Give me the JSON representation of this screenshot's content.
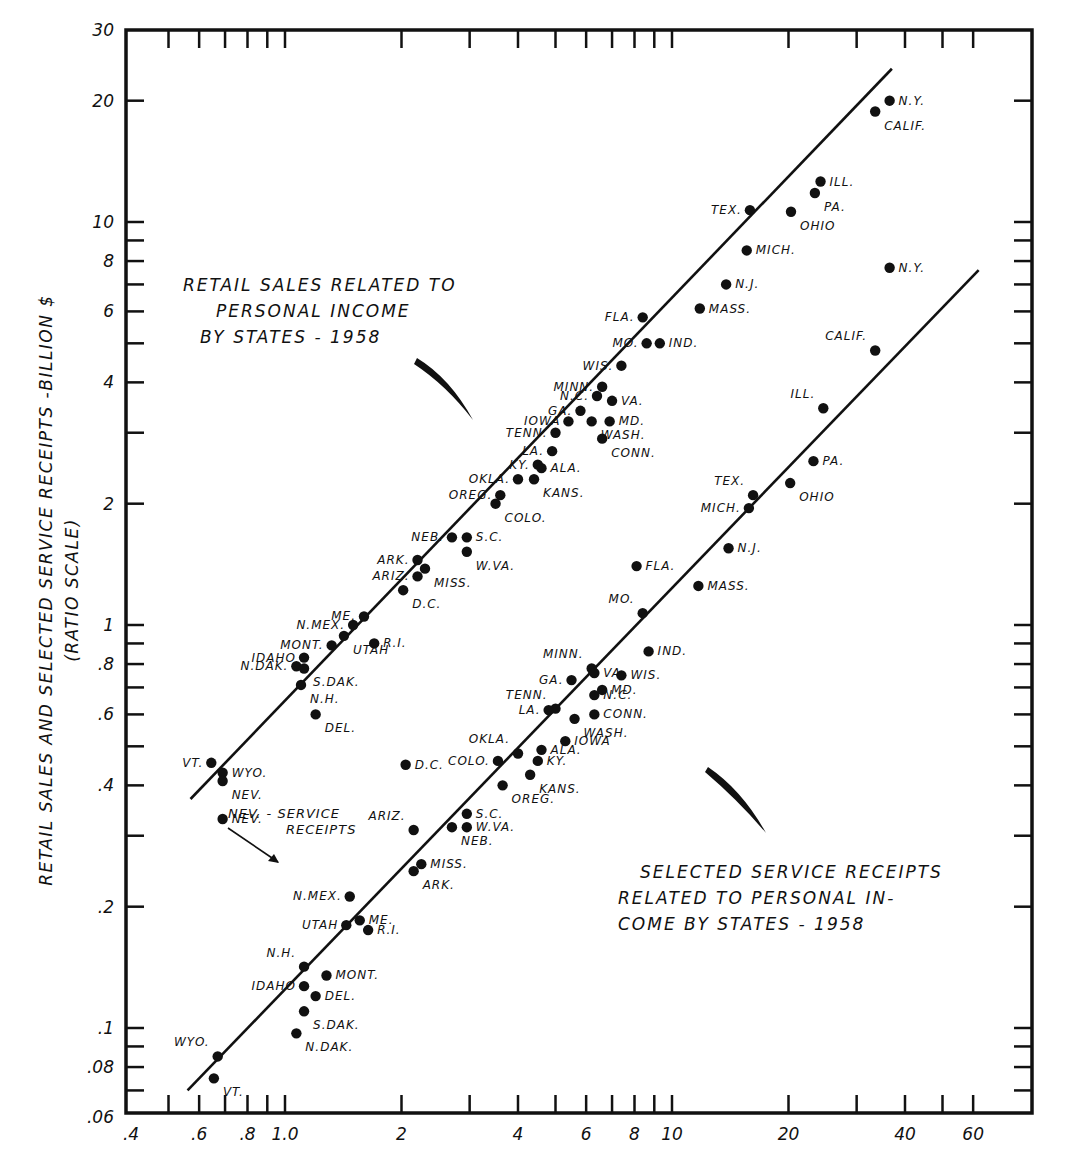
{
  "chart_data": {
    "type": "scatter",
    "xlabel": "",
    "ylabel": "RETAIL SALES AND SELECTED SERVICE RECEIPTS -BILLION $",
    "ylabel_sub": "(RATIO SCALE)",
    "xscale": "log",
    "yscale": "log",
    "xlim": [
      0.4,
      62
    ],
    "ylim": [
      0.06,
      30
    ],
    "x_ticks": [
      ".4",
      ".6",
      ".8",
      "1.0",
      "2",
      "4",
      "6",
      "8",
      "10",
      "20",
      "40",
      "60"
    ],
    "x_tick_values": [
      0.4,
      0.6,
      0.8,
      1.0,
      2,
      4,
      6,
      8,
      10,
      20,
      40,
      60
    ],
    "x_minor_ticks": [
      0.5,
      0.7,
      0.9,
      3,
      5,
      7,
      9,
      30,
      50
    ],
    "y_ticks": [
      "30",
      "20",
      "10",
      "8",
      "6",
      "4",
      "2",
      "1",
      ".8",
      ".6",
      ".4",
      ".2",
      ".1",
      ".08",
      ".06"
    ],
    "y_tick_values": [
      30,
      20,
      10,
      8,
      6,
      4,
      2,
      1,
      0.8,
      0.6,
      0.4,
      0.2,
      0.1,
      0.08,
      0.06
    ],
    "y_minor_ticks": [
      9,
      7,
      5,
      3,
      0.9,
      0.7,
      0.5,
      0.3,
      0.09,
      0.07
    ],
    "grid": false,
    "annotations": [
      {
        "text_lines": [
          "RETAIL SALES RELATED TO",
          "PERSONAL INCOME",
          "BY STATES - 1958"
        ]
      },
      {
        "text_lines": [
          "SELECTED SERVICE RECEIPTS",
          "RELATED TO PERSONAL IN-",
          "COME BY STATES - 1958"
        ]
      },
      {
        "text_lines": [
          "NEV. - SERVICE",
          "RECEIPTS"
        ]
      }
    ],
    "series": [
      {
        "name": "Retail Sales",
        "fit_line": {
          "x": [
            0.57,
            37
          ],
          "y": [
            0.37,
            24
          ]
        },
        "points": [
          {
            "state": "N.Y.",
            "x": 36.5,
            "y": 20.0
          },
          {
            "state": "CALIF.",
            "x": 33.5,
            "y": 18.8
          },
          {
            "state": "ILL.",
            "x": 24.2,
            "y": 12.6
          },
          {
            "state": "PA.",
            "x": 23.4,
            "y": 11.8
          },
          {
            "state": "OHIO",
            "x": 20.3,
            "y": 10.6
          },
          {
            "state": "TEX.",
            "x": 15.9,
            "y": 10.7
          },
          {
            "state": "MICH.",
            "x": 15.6,
            "y": 8.5
          },
          {
            "state": "N.J.",
            "x": 13.8,
            "y": 7.0
          },
          {
            "state": "MASS.",
            "x": 11.8,
            "y": 6.1
          },
          {
            "state": "FLA.",
            "x": 8.4,
            "y": 5.8
          },
          {
            "state": "MO.",
            "x": 8.6,
            "y": 5.0
          },
          {
            "state": "IND.",
            "x": 9.3,
            "y": 5.0
          },
          {
            "state": "WIS.",
            "x": 7.4,
            "y": 4.4
          },
          {
            "state": "MINN.",
            "x": 6.6,
            "y": 3.9
          },
          {
            "state": "N.C.",
            "x": 6.4,
            "y": 3.7
          },
          {
            "state": "VA.",
            "x": 7.0,
            "y": 3.6
          },
          {
            "state": "GA.",
            "x": 5.8,
            "y": 3.4
          },
          {
            "state": "WASH.",
            "x": 6.2,
            "y": 3.2
          },
          {
            "state": "MD.",
            "x": 6.9,
            "y": 3.2
          },
          {
            "state": "IOWA",
            "x": 5.4,
            "y": 3.2
          },
          {
            "state": "TENN.",
            "x": 5.0,
            "y": 3.0
          },
          {
            "state": "CONN.",
            "x": 6.6,
            "y": 2.9
          },
          {
            "state": "LA.",
            "x": 4.9,
            "y": 2.7
          },
          {
            "state": "KY.",
            "x": 4.5,
            "y": 2.5
          },
          {
            "state": "ALA.",
            "x": 4.6,
            "y": 2.45
          },
          {
            "state": "KANS.",
            "x": 4.4,
            "y": 2.3
          },
          {
            "state": "OKLA.",
            "x": 4.0,
            "y": 2.3
          },
          {
            "state": "OREG.",
            "x": 3.6,
            "y": 2.1
          },
          {
            "state": "COLO.",
            "x": 3.5,
            "y": 2.0
          },
          {
            "state": "NEB.",
            "x": 2.7,
            "y": 1.65
          },
          {
            "state": "S.C.",
            "x": 2.95,
            "y": 1.65
          },
          {
            "state": "W.VA.",
            "x": 2.95,
            "y": 1.52
          },
          {
            "state": "ARK.",
            "x": 2.2,
            "y": 1.45
          },
          {
            "state": "MISS.",
            "x": 2.3,
            "y": 1.38
          },
          {
            "state": "ARIZ.",
            "x": 2.2,
            "y": 1.32
          },
          {
            "state": "D.C.",
            "x": 2.02,
            "y": 1.22
          },
          {
            "state": "ME.",
            "x": 1.6,
            "y": 1.05
          },
          {
            "state": "N.MEX.",
            "x": 1.5,
            "y": 1.0
          },
          {
            "state": "UTAH",
            "x": 1.42,
            "y": 0.94
          },
          {
            "state": "R.I.",
            "x": 1.7,
            "y": 0.9
          },
          {
            "state": "MONT.",
            "x": 1.32,
            "y": 0.89
          },
          {
            "state": "IDAHO",
            "x": 1.12,
            "y": 0.83
          },
          {
            "state": "N.DAK.",
            "x": 1.07,
            "y": 0.79
          },
          {
            "state": "S.DAK.",
            "x": 1.12,
            "y": 0.78
          },
          {
            "state": "N.H.",
            "x": 1.1,
            "y": 0.71
          },
          {
            "state": "DEL.",
            "x": 1.2,
            "y": 0.6
          },
          {
            "state": "VT.",
            "x": 0.645,
            "y": 0.455
          },
          {
            "state": "WYO.",
            "x": 0.69,
            "y": 0.43
          },
          {
            "state": "NEV.",
            "x": 0.69,
            "y": 0.41
          }
        ]
      },
      {
        "name": "Selected Service Receipts",
        "fit_line": {
          "x": [
            0.56,
            62
          ],
          "y": [
            0.07,
            7.6
          ]
        },
        "points": [
          {
            "state": "N.Y.",
            "x": 36.5,
            "y": 7.7
          },
          {
            "state": "CALIF.",
            "x": 33.5,
            "y": 4.8
          },
          {
            "state": "ILL.",
            "x": 24.6,
            "y": 3.45
          },
          {
            "state": "PA.",
            "x": 23.2,
            "y": 2.55
          },
          {
            "state": "OHIO",
            "x": 20.2,
            "y": 2.25
          },
          {
            "state": "TEX.",
            "x": 16.2,
            "y": 2.1
          },
          {
            "state": "MICH.",
            "x": 15.8,
            "y": 1.95
          },
          {
            "state": "N.J.",
            "x": 14.0,
            "y": 1.55
          },
          {
            "state": "MASS.",
            "x": 11.7,
            "y": 1.25
          },
          {
            "state": "FLA.",
            "x": 8.1,
            "y": 1.4
          },
          {
            "state": "MO.",
            "x": 8.4,
            "y": 1.07
          },
          {
            "state": "IND.",
            "x": 8.7,
            "y": 0.86
          },
          {
            "state": "MINN.",
            "x": 6.2,
            "y": 0.78
          },
          {
            "state": "VA.",
            "x": 6.3,
            "y": 0.76
          },
          {
            "state": "WIS.",
            "x": 7.4,
            "y": 0.75
          },
          {
            "state": "GA.",
            "x": 5.5,
            "y": 0.73
          },
          {
            "state": "MD.",
            "x": 6.6,
            "y": 0.69
          },
          {
            "state": "N.C.",
            "x": 6.3,
            "y": 0.67
          },
          {
            "state": "TENN.",
            "x": 5.0,
            "y": 0.62
          },
          {
            "state": "LA.",
            "x": 4.8,
            "y": 0.615
          },
          {
            "state": "CONN.",
            "x": 6.3,
            "y": 0.6
          },
          {
            "state": "WASH.",
            "x": 5.6,
            "y": 0.585
          },
          {
            "state": "IOWA",
            "x": 5.3,
            "y": 0.515
          },
          {
            "state": "OKLA.",
            "x": 4.0,
            "y": 0.48
          },
          {
            "state": "ALA.",
            "x": 4.6,
            "y": 0.49
          },
          {
            "state": "KY.",
            "x": 4.5,
            "y": 0.46
          },
          {
            "state": "COLO.",
            "x": 3.55,
            "y": 0.46
          },
          {
            "state": "KANS.",
            "x": 4.3,
            "y": 0.425
          },
          {
            "state": "OREG.",
            "x": 3.65,
            "y": 0.4
          },
          {
            "state": "D.C.",
            "x": 2.05,
            "y": 0.45
          },
          {
            "state": "S.C.",
            "x": 2.95,
            "y": 0.34
          },
          {
            "state": "W.VA.",
            "x": 2.95,
            "y": 0.315
          },
          {
            "state": "NEB.",
            "x": 2.7,
            "y": 0.315
          },
          {
            "state": "ARIZ.",
            "x": 2.15,
            "y": 0.31
          },
          {
            "state": "MISS.",
            "x": 2.25,
            "y": 0.255
          },
          {
            "state": "ARK.",
            "x": 2.15,
            "y": 0.245
          },
          {
            "state": "NEV.",
            "x": 0.69,
            "y": 0.33
          },
          {
            "state": "N.MEX.",
            "x": 1.47,
            "y": 0.212
          },
          {
            "state": "ME.",
            "x": 1.56,
            "y": 0.185
          },
          {
            "state": "UTAH",
            "x": 1.44,
            "y": 0.18
          },
          {
            "state": "R.I.",
            "x": 1.64,
            "y": 0.175
          },
          {
            "state": "N.H.",
            "x": 1.12,
            "y": 0.142
          },
          {
            "state": "MONT.",
            "x": 1.28,
            "y": 0.135
          },
          {
            "state": "IDAHO",
            "x": 1.12,
            "y": 0.127
          },
          {
            "state": "DEL.",
            "x": 1.2,
            "y": 0.12
          },
          {
            "state": "S.DAK.",
            "x": 1.12,
            "y": 0.11
          },
          {
            "state": "N.DAK.",
            "x": 1.07,
            "y": 0.097
          },
          {
            "state": "WYO.",
            "x": 0.67,
            "y": 0.085
          },
          {
            "state": "VT.",
            "x": 0.655,
            "y": 0.075
          }
        ]
      }
    ]
  },
  "labels": {
    "ylabel": "RETAIL SALES AND SELECTED SERVICE RECEIPTS -BILLION $",
    "ylabel_sub": "(RATIO SCALE)",
    "retail_title": [
      "RETAIL SALES RELATED TO",
      "PERSONAL INCOME",
      "BY STATES - 1958"
    ],
    "service_title": [
      "SELECTED SERVICE RECEIPTS",
      "RELATED TO PERSONAL IN-",
      "COME BY STATES - 1958"
    ],
    "nev_note": [
      "NEV. - SERVICE",
      "RECEIPTS"
    ]
  },
  "colors": {
    "ink": "#111111",
    "paper": "#ffffff"
  }
}
